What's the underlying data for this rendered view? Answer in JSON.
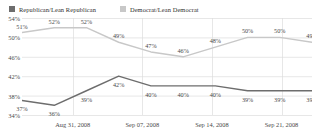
{
  "legend": {
    "republican": {
      "label": "Republican/Lean Republican",
      "color": "#6d6d6d",
      "swatch": "legend-swatch-republican"
    },
    "democrat": {
      "label": "Democrat/Lean Democrat",
      "color": "#c8c8c8",
      "swatch": "legend-swatch-democrat"
    }
  },
  "chart_data": {
    "type": "line",
    "title": "",
    "xlabel": "",
    "ylabel": "",
    "ylim": [
      34,
      54
    ],
    "yticks": [
      54,
      50,
      46,
      42,
      38,
      34
    ],
    "ytick_labels": [
      "54%",
      "50%",
      "46%",
      "42%",
      "38%",
      "34%"
    ],
    "grid": true,
    "legend_position": "top-left",
    "x": [
      "Aug 27, 2008",
      "Aug 31, 2008",
      "Sep 03, 2008",
      "Sep 07, 2008",
      "Sep 10, 2008",
      "Sep 14, 2008",
      "Sep 17, 2008",
      "Sep 21, 2008",
      "Sep 24, 2008",
      "Sep 28, 2008"
    ],
    "xticks": [
      "Aug 31, 2008",
      "Sep 07, 2008",
      "Sep 14, 2008",
      "Sep 21, 2008"
    ],
    "xtick_positions": [
      0.175,
      0.415,
      0.655,
      0.895
    ],
    "series": [
      {
        "name": "Democrat/Lean Democrat",
        "color": "#c8c8c8",
        "values": [
          51,
          52,
          52,
          49,
          47,
          46,
          48,
          50,
          50,
          49
        ],
        "labels": [
          "51%",
          "52%",
          "52%",
          "49%",
          "47%",
          "46%",
          "48%",
          "50%",
          "50%",
          "49%"
        ]
      },
      {
        "name": "Republican/Lean Republican",
        "color": "#6d6d6d",
        "values": [
          37,
          36,
          39,
          42,
          40,
          40,
          40,
          39,
          39,
          39
        ],
        "labels": [
          "37%",
          "36%",
          "39%",
          "42%",
          "40%",
          "40%",
          "40%",
          "39%",
          "39%",
          "39%"
        ]
      }
    ]
  }
}
